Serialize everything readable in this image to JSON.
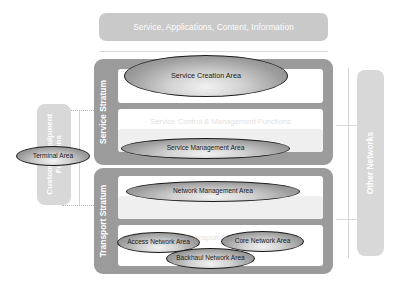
{
  "diagram": {
    "top_banner": {
      "label": "Service, Applications, Content, Information"
    },
    "strata": [
      {
        "id": "service-stratum",
        "label": "Service Stratum",
        "functions": [
          {
            "id": "service-support-functions",
            "label": "Service Support Functions"
          },
          {
            "id": "service-control-management-functions",
            "label": "Service Control & Management Functions"
          }
        ]
      },
      {
        "id": "transport-stratum",
        "label": "Transport Stratum",
        "functions": [
          {
            "id": "network-control-management-functions",
            "label": "Network Control & Management Functions"
          },
          {
            "id": "transport-functions",
            "label": "Transport Functions"
          }
        ]
      }
    ],
    "areas": [
      {
        "id": "service-creation-area",
        "label": "Service Creation Area"
      },
      {
        "id": "service-management-area",
        "label": "Service Management Area"
      },
      {
        "id": "network-management-area",
        "label": "Network Management Area"
      },
      {
        "id": "access-network-area",
        "label": "Access Network Area"
      },
      {
        "id": "core-network-area",
        "label": "Core Network Area"
      },
      {
        "id": "backhaul-network-area",
        "label": "Backhaul Network Area"
      },
      {
        "id": "terminal-area",
        "label": "Terminal Area"
      }
    ],
    "side_panels": {
      "customer_equipment": {
        "label_line1": "Customer Equipment",
        "label_line2": "Functions"
      },
      "other_networks": {
        "label": "Other Networks"
      }
    },
    "colors": {
      "background": "#ffffff",
      "banner_fill": "#c9c9c9",
      "stratum_fill": "#9b9b9b",
      "side_panel_fill": "#d8d8d8",
      "function_box_fill": "#ffffff",
      "function_box_shaded_fill": "#efefef",
      "function_label_text": "#e2e2e2",
      "banner_text": "#ffffff",
      "ellipse_outline": "#1a1a1a",
      "ellipse_text": "#1b1b1b",
      "separator_line": "#d9d9d9"
    }
  }
}
